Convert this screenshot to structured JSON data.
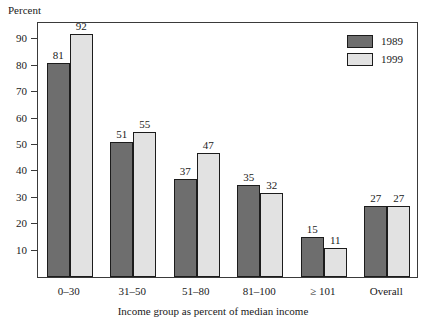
{
  "chart_data": {
    "type": "bar",
    "title": "",
    "subtitle": "",
    "xlabel": "Income group as percent of median income",
    "ylabel": "Percent",
    "categories": [
      "0–30",
      "31–50",
      "51–80",
      "81–100",
      "≥ 101",
      "Overall"
    ],
    "series": [
      {
        "name": "1989",
        "color": "#6e6e6e",
        "values": [
          81,
          51,
          37,
          35,
          15,
          27
        ]
      },
      {
        "name": "1999",
        "color": "#e2e2e2",
        "values": [
          92,
          55,
          47,
          32,
          11,
          27
        ]
      }
    ],
    "ylim": [
      0,
      97
    ],
    "yticks": [
      10,
      20,
      30,
      40,
      50,
      60,
      70,
      80,
      90
    ],
    "ytick_labels": [
      "10",
      "20",
      "30",
      "40",
      "50",
      "60",
      "70",
      "80",
      "90"
    ],
    "grid": false,
    "legend_position": "top-right",
    "value_labels": true,
    "frame": "box",
    "bar_edge_color": "#1c1c1c"
  },
  "legend": {
    "entries": [
      {
        "label": "1989"
      },
      {
        "label": "1999"
      }
    ]
  }
}
